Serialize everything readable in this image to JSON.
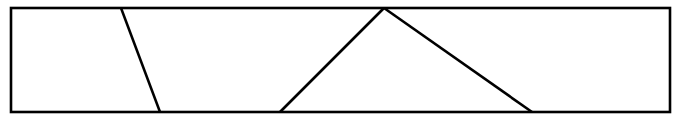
{
  "figure": {
    "title": "Rectangle partitioned by three straight lines",
    "background_color": "#ffffff",
    "stroke_color": "#000000",
    "canvas": {
      "width": 682,
      "height": 121
    },
    "outline": {
      "label": "rectangle-outline",
      "shape": "rectangle",
      "x": 11,
      "y": 8,
      "width": 659,
      "height": 104,
      "stroke_width": 2.6,
      "fill": "none"
    },
    "segments": [
      {
        "label": "slanted-divider-left",
        "description": "Single diagonal from top edge down-right to bottom edge",
        "x1": 121,
        "y1": 8,
        "x2": 160,
        "y2": 112,
        "stroke_width": 2.6
      },
      {
        "label": "triangle-left-leg",
        "description": "Rises from bottom edge up-right to apex on top edge",
        "x1": 280,
        "y1": 112,
        "x2": 384,
        "y2": 8,
        "stroke_width": 2.6
      },
      {
        "label": "triangle-right-leg",
        "description": "Descends from apex on top edge down-right to bottom edge",
        "x1": 384,
        "y1": 8,
        "x2": 532,
        "y2": 112,
        "stroke_width": 2.6
      }
    ],
    "vertices": [
      {
        "label": "rect-top-left",
        "x": 11,
        "y": 8
      },
      {
        "label": "rect-top-right",
        "x": 670,
        "y": 8
      },
      {
        "label": "rect-bottom-right",
        "x": 670,
        "y": 112
      },
      {
        "label": "rect-bottom-left",
        "x": 11,
        "y": 112
      },
      {
        "label": "divider-top",
        "x": 121,
        "y": 8
      },
      {
        "label": "divider-bottom",
        "x": 160,
        "y": 112
      },
      {
        "label": "triangle-base-left",
        "x": 280,
        "y": 112
      },
      {
        "label": "triangle-apex",
        "x": 384,
        "y": 8
      },
      {
        "label": "triangle-base-right",
        "x": 532,
        "y": 112
      }
    ],
    "regions": [
      {
        "label": "region-1-left-quadrilateral"
      },
      {
        "label": "region-2-middle-quadrilateral"
      },
      {
        "label": "region-3-triangle"
      },
      {
        "label": "region-4-right-quadrilateral"
      }
    ]
  }
}
